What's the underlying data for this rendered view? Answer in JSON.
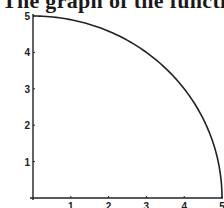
{
  "caption": "The graph of the function",
  "chart_data": {
    "type": "line",
    "title": "",
    "xlabel": "",
    "ylabel": "",
    "xlim": [
      0,
      5
    ],
    "ylim": [
      0,
      5
    ],
    "x_ticks": [
      "1",
      "2",
      "3",
      "4",
      "5"
    ],
    "y_ticks": [
      "1",
      "2",
      "3",
      "4",
      "5"
    ],
    "grid": false,
    "legend": null,
    "series": [
      {
        "name": "quarter circle y = sqrt(25 - x^2)",
        "x": [
          0,
          0.5,
          1,
          1.5,
          2,
          2.5,
          3,
          3.5,
          4,
          4.5,
          4.8,
          5
        ],
        "y": [
          5,
          4.97,
          4.9,
          4.77,
          4.58,
          4.33,
          4.0,
          3.57,
          3.0,
          2.18,
          1.4,
          0
        ]
      }
    ]
  }
}
